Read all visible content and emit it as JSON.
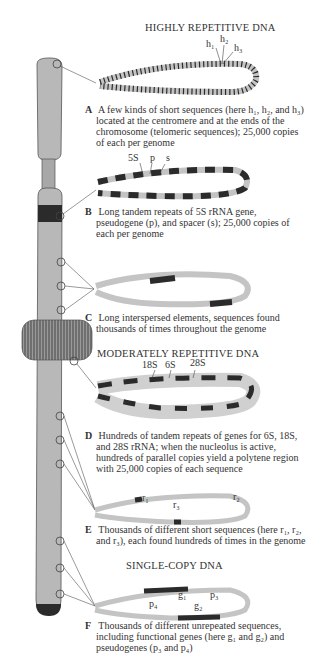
{
  "headings": {
    "highly_repetitive": "HIGHLY REPETITIVE DNA",
    "moderately_repetitive": "MODERATELY REPETITIVE DNA",
    "single_copy": "SINGLE-COPY DNA"
  },
  "panels": [
    {
      "letter": "A",
      "caption": "A few kinds of short sequences (here h₁, h₂, and h₃) located at the centromere and at the ends of the chromosome (telomeric sequences); 25,000 copies of each per genome",
      "labels": [
        "h₁",
        "h₂",
        "h₃"
      ]
    },
    {
      "letter": "B",
      "caption": "Long tandem repeats of 5S rRNA gene, pseudogene (p), and spacer (s); 25,000 copies of each per genome",
      "labels": [
        "5S",
        "p",
        "s"
      ]
    },
    {
      "letter": "C",
      "caption": "Long interspersed elements, sequences found thousands of times throughout the genome",
      "labels": []
    },
    {
      "letter": "D",
      "caption": "Hundreds of tandem repeats of genes for 6S, 18S, and 28S rRNA; when the nucleolus is active, hundreds of parallel copies yield a polytene region with 25,000 copies of each sequence",
      "labels": [
        "18S",
        "6S",
        "28S"
      ]
    },
    {
      "letter": "E",
      "caption": "Thousands of different short sequences (here r₁, r₂, and r₃), each found hundreds of times in the genome",
      "labels": [
        "r₁",
        "r₂",
        "r₃"
      ]
    },
    {
      "letter": "F",
      "caption": "Thousands of different unrepeated sequences, including functional genes (here g₁ and g₂) and pseudogenes (p₃ and p₄)",
      "labels": [
        "g₁",
        "g₂",
        "p₃",
        "p₄"
      ]
    }
  ],
  "colors": {
    "chromosome": "#b8b8b8",
    "chromosome_outline": "#555555",
    "band_dark": "#2b2b2b",
    "dna_strand": "#c4c4c4",
    "text": "#333333"
  }
}
